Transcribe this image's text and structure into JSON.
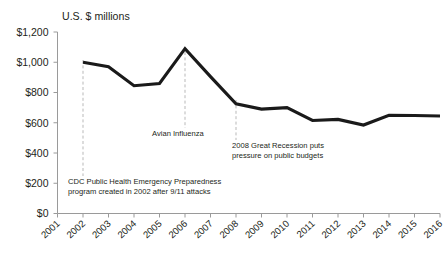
{
  "chart_data": {
    "type": "line",
    "title": "",
    "axis_note": "U.S. $ millions",
    "xlabel": "",
    "ylabel": "U.S. $ millions",
    "x": [
      2001,
      2002,
      2003,
      2004,
      2005,
      2006,
      2007,
      2008,
      2009,
      2010,
      2011,
      2012,
      2013,
      2014,
      2015,
      2016
    ],
    "categories": [
      "2001",
      "2002",
      "2003",
      "2004",
      "2005",
      "2006",
      "2007",
      "2008",
      "2009",
      "2010",
      "2011",
      "2012",
      "2013",
      "2014",
      "2015",
      "2016"
    ],
    "series": [
      {
        "name": "CDC Public Health Emergency Preparedness funding",
        "x": [
          2002,
          2003,
          2004,
          2005,
          2006,
          2007,
          2008,
          2009,
          2010,
          2011,
          2012,
          2013,
          2014,
          2015,
          2016
        ],
        "values": [
          1000,
          970,
          845,
          860,
          1090,
          905,
          725,
          690,
          700,
          615,
          622,
          585,
          650,
          648,
          645
        ],
        "color": "#1a1a1a"
      }
    ],
    "ylim": [
      0,
      1200
    ],
    "yticks": [
      0,
      200,
      400,
      600,
      800,
      1000,
      1200
    ],
    "ytick_labels": [
      "$0",
      "$200",
      "$400",
      "$600",
      "$800",
      "$1,000",
      "$1,200"
    ],
    "xtick_labels": [
      "2001",
      "2002",
      "2003",
      "2004",
      "2005",
      "2006",
      "2007",
      "2008",
      "2009",
      "2010",
      "2011",
      "2012",
      "2013",
      "2014",
      "2015",
      "2016"
    ],
    "grid": false,
    "legend": "none",
    "annotations": [
      {
        "id": "cdc-phep",
        "anchor_year": 2002,
        "line1": "CDC Public Health Emergency Preparedness",
        "line2": "program created in 2002 after 9/11 attacks"
      },
      {
        "id": "avian-influenza",
        "anchor_year": 2006,
        "line1": "Avian Influenza",
        "line2": ""
      },
      {
        "id": "great-recession",
        "anchor_year": 2008,
        "line1": "2008 Great Recession puts",
        "line2": "pressure on public budgets"
      }
    ]
  },
  "colors": {
    "line": "#1a1a1a",
    "axis": "#9a9a9a",
    "leader": "#b9b9b9",
    "text": "#231f20",
    "background": "#ffffff"
  }
}
